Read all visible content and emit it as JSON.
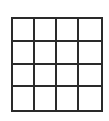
{
  "grid": {
    "rows": 4,
    "cols": 4,
    "line_color": "#2a2a2a",
    "fill_color": "#ffffff"
  }
}
